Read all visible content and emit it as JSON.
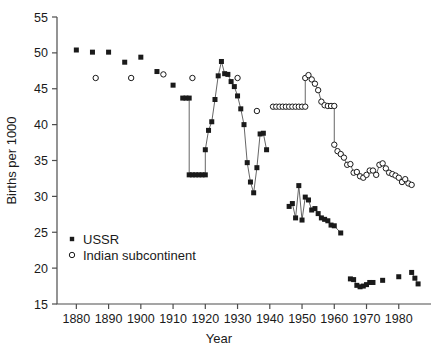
{
  "chart_data": {
    "type": "scatter",
    "title": "",
    "xlabel": "Year",
    "ylabel": "Births per 1000",
    "xlim": [
      1874,
      1990
    ],
    "ylim": [
      15,
      55
    ],
    "xticks": [
      1880,
      1890,
      1900,
      1910,
      1920,
      1930,
      1940,
      1950,
      1960,
      1970,
      1980
    ],
    "yticks": [
      15,
      20,
      25,
      30,
      35,
      40,
      45,
      50,
      55
    ],
    "grid": false,
    "legend_position": "lower-left",
    "series": [
      {
        "name": "USSR",
        "marker": "filled-square",
        "color": "#1a1a1a",
        "connected_segments": [
          [
            [
              1914,
              43.7
            ],
            [
              1915,
              43.7
            ],
            [
              1915,
              33.0
            ],
            [
              1916,
              33.0
            ],
            [
              1917,
              33.0
            ],
            [
              1918,
              33.0
            ],
            [
              1919,
              33.0
            ],
            [
              1920,
              33.0
            ],
            [
              1920,
              36.5
            ],
            [
              1921,
              39.2
            ],
            [
              1922,
              40.4
            ],
            [
              1923,
              43.5
            ],
            [
              1924,
              46.8
            ],
            [
              1925,
              48.8
            ],
            [
              1926,
              47.1
            ],
            [
              1927,
              47.0
            ],
            [
              1928,
              46.0
            ],
            [
              1929,
              45.3
            ],
            [
              1930,
              44.0
            ],
            [
              1931,
              42.2
            ],
            [
              1932,
              40.0
            ],
            [
              1933,
              34.7
            ],
            [
              1934,
              32.0
            ],
            [
              1935,
              30.5
            ],
            [
              1936,
              34.0
            ],
            [
              1937,
              38.7
            ],
            [
              1938,
              38.8
            ],
            [
              1939,
              36.5
            ]
          ],
          [
            [
              1946,
              28.6
            ],
            [
              1947,
              29.0
            ],
            [
              1948,
              27.0
            ],
            [
              1949,
              31.5
            ],
            [
              1950,
              26.7
            ],
            [
              1951,
              29.9
            ],
            [
              1952,
              29.5
            ],
            [
              1953,
              28.1
            ],
            [
              1954,
              28.3
            ],
            [
              1955,
              27.6
            ],
            [
              1956,
              27.0
            ],
            [
              1957,
              26.8
            ],
            [
              1958,
              26.6
            ],
            [
              1959,
              26.0
            ],
            [
              1960,
              25.9
            ],
            [
              1962,
              24.9
            ]
          ],
          [
            [
              1965,
              18.5
            ],
            [
              1966,
              18.4
            ],
            [
              1967,
              17.6
            ],
            [
              1968,
              17.4
            ],
            [
              1969,
              17.5
            ],
            [
              1970,
              17.7
            ],
            [
              1971,
              18.0
            ],
            [
              1972,
              18.0
            ]
          ],
          [
            [
              1984,
              19.4
            ],
            [
              1985,
              18.6
            ],
            [
              1986,
              17.8
            ]
          ]
        ],
        "isolated_points": [
          [
            1880,
            50.4
          ],
          [
            1885,
            50.1
          ],
          [
            1890,
            50.1
          ],
          [
            1895,
            48.7
          ],
          [
            1900,
            49.4
          ],
          [
            1905,
            47.4
          ],
          [
            1910,
            45.5
          ],
          [
            1913,
            43.7
          ],
          [
            1975,
            18.3
          ],
          [
            1980,
            18.8
          ]
        ]
      },
      {
        "name": "Indian subcontinent",
        "marker": "open-circle",
        "color": "#1a1a1a",
        "connected_segments": [
          [
            [
              1941,
              42.5
            ],
            [
              1942,
              42.5
            ],
            [
              1943,
              42.5
            ],
            [
              1944,
              42.5
            ],
            [
              1945,
              42.5
            ],
            [
              1946,
              42.5
            ],
            [
              1947,
              42.5
            ],
            [
              1948,
              42.5
            ],
            [
              1949,
              42.5
            ],
            [
              1950,
              42.5
            ],
            [
              1951,
              42.5
            ],
            [
              1951,
              46.5
            ],
            [
              1952,
              46.9
            ],
            [
              1953,
              46.3
            ],
            [
              1954,
              45.7
            ],
            [
              1955,
              44.8
            ],
            [
              1956,
              43.2
            ],
            [
              1957,
              42.7
            ],
            [
              1958,
              42.6
            ],
            [
              1959,
              42.6
            ],
            [
              1960,
              42.6
            ],
            [
              1960,
              37.2
            ],
            [
              1961,
              36.3
            ],
            [
              1962,
              35.9
            ],
            [
              1963,
              35.4
            ],
            [
              1964,
              34.4
            ],
            [
              1965,
              34.5
            ],
            [
              1966,
              33.3
            ],
            [
              1967,
              33.4
            ],
            [
              1968,
              32.8
            ],
            [
              1969,
              32.6
            ],
            [
              1970,
              33.0
            ],
            [
              1971,
              33.6
            ],
            [
              1972,
              33.6
            ],
            [
              1973,
              33.0
            ],
            [
              1974,
              34.4
            ],
            [
              1975,
              34.6
            ],
            [
              1976,
              33.9
            ],
            [
              1977,
              33.3
            ],
            [
              1978,
              33.1
            ],
            [
              1979,
              32.9
            ],
            [
              1980,
              32.6
            ],
            [
              1981,
              32.0
            ],
            [
              1982,
              32.4
            ],
            [
              1983,
              31.8
            ],
            [
              1984,
              31.6
            ]
          ]
        ],
        "isolated_points": [
          [
            1886,
            46.5
          ],
          [
            1897,
            46.5
          ],
          [
            1907,
            47.0
          ],
          [
            1916,
            46.5
          ],
          [
            1930,
            46.5
          ],
          [
            1936,
            41.9
          ]
        ]
      }
    ],
    "legend": [
      {
        "label": "USSR",
        "marker": "filled-square"
      },
      {
        "label": "Indian subcontinent",
        "marker": "open-circle"
      }
    ]
  },
  "axes": {
    "xlabel": "Year",
    "ylabel": "Births per 1000",
    "xtick_labels": [
      "1880",
      "1890",
      "1900",
      "1910",
      "1920",
      "1930",
      "1940",
      "1950",
      "1960",
      "1970",
      "1980"
    ],
    "ytick_labels": [
      "15",
      "20",
      "25",
      "30",
      "35",
      "40",
      "45",
      "50",
      "55"
    ]
  },
  "colors": {
    "marker": "#1a1a1a",
    "line": "#555555",
    "axis": "#4d4d4d",
    "background": "#ffffff"
  }
}
